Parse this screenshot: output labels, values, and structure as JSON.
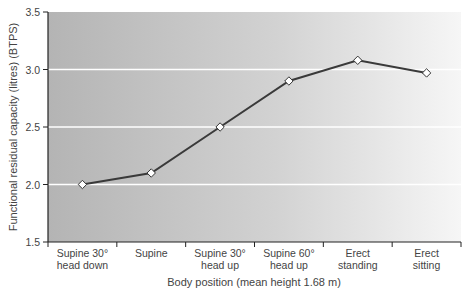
{
  "chart_data": {
    "type": "line",
    "title": "",
    "xlabel": "Body position (mean height 1.68 m)",
    "ylabel": "Functional residual capacity (litres) (BTPS)",
    "categories": [
      [
        "Supine 30°",
        "head down"
      ],
      [
        "Supine"
      ],
      [
        "Supine 30°",
        "head up"
      ],
      [
        "Supine 60°",
        "head up"
      ],
      [
        "Erect",
        "standing"
      ],
      [
        "Erect",
        "sitting"
      ]
    ],
    "values": [
      2.0,
      2.1,
      2.5,
      2.9,
      3.08,
      2.97
    ],
    "ylim": [
      1.5,
      3.5
    ],
    "yticks": [
      "1.5",
      "2.0",
      "2.5",
      "3.0",
      "3.5"
    ],
    "grid": true,
    "legend": null,
    "marker": "diamond-open"
  },
  "colors": {
    "line": "#3a3a3a",
    "grid": "#ffffff",
    "bg_left": "#b4b4b4",
    "bg_right": "#f4f4f4"
  }
}
